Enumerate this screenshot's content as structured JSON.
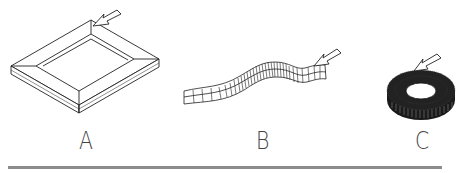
{
  "figure": {
    "colors": {
      "line": "#222222",
      "fill": "#ffffff",
      "rule": "#8c8c8c",
      "label": "#444444"
    },
    "items": [
      {
        "id": "A",
        "label": "A",
        "shape": "rectangular frame (bevelled tray)",
        "has_arrow": true
      },
      {
        "id": "B",
        "label": "B",
        "shape": "wavy segmented strip",
        "has_arrow": true
      },
      {
        "id": "C",
        "label": "C",
        "shape": "toroidal ring (coil)",
        "has_arrow": true
      }
    ]
  }
}
